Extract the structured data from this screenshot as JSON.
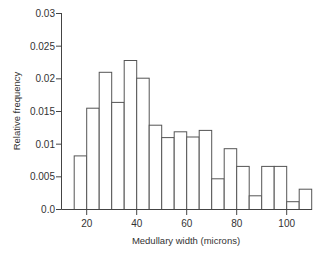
{
  "chart_data": {
    "type": "bar",
    "title": "",
    "xlabel": "Medullary width (microns)",
    "ylabel": "Relative frequency",
    "bin_width": 5,
    "bin_edges": [
      15,
      20,
      25,
      30,
      35,
      40,
      45,
      50,
      55,
      60,
      65,
      70,
      75,
      80,
      85,
      90,
      95,
      100,
      105,
      110
    ],
    "categories": [
      "15-20",
      "20-25",
      "25-30",
      "30-35",
      "35-40",
      "40-45",
      "45-50",
      "50-55",
      "55-60",
      "60-65",
      "65-70",
      "70-75",
      "75-80",
      "80-85",
      "85-90",
      "90-95",
      "95-100",
      "100-105",
      "105-110"
    ],
    "values": [
      0.0082,
      0.0155,
      0.021,
      0.0164,
      0.0228,
      0.0201,
      0.0129,
      0.011,
      0.0119,
      0.0111,
      0.0121,
      0.0047,
      0.0093,
      0.0066,
      0.0021,
      0.0066,
      0.0066,
      0.0012,
      0.0031
    ],
    "xlim": [
      10,
      112
    ],
    "ylim": [
      0,
      0.03
    ],
    "x_ticks": [
      20,
      40,
      60,
      80,
      100
    ],
    "y_ticks": [
      0.0,
      0.005,
      0.01,
      0.015,
      0.02,
      0.025,
      0.03
    ],
    "y_tick_labels": [
      "0.0",
      "0.005",
      "0.01",
      "0.015",
      "0.02",
      "0.025",
      "0.03"
    ],
    "grid": false,
    "legend": null
  }
}
